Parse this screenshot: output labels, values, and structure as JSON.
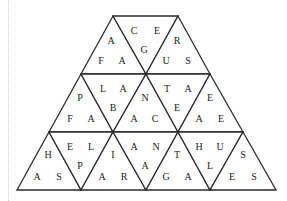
{
  "puzzle": {
    "type": "triangle-tarsia",
    "rows": 3,
    "triangles": [
      {
        "row": 0,
        "pts": "113,16 81,74 146,74",
        "dir": "up",
        "letters": [
          {
            "t": "A",
            "x": 111,
            "y": 42
          },
          {
            "t": "F",
            "x": 101,
            "y": 62
          },
          {
            "t": "A",
            "x": 122,
            "y": 62
          }
        ]
      },
      {
        "row": 0,
        "pts": "113,16 178,16 146,74",
        "dir": "down",
        "letters": [
          {
            "t": "C",
            "x": 134,
            "y": 32
          },
          {
            "t": "E",
            "x": 157,
            "y": 32
          },
          {
            "t": "G",
            "x": 144,
            "y": 51
          }
        ]
      },
      {
        "row": 0,
        "pts": "178,16 146,74 210,74",
        "dir": "up",
        "letters": [
          {
            "t": "R",
            "x": 177,
            "y": 42
          },
          {
            "t": "U",
            "x": 166,
            "y": 62
          },
          {
            "t": "S",
            "x": 188,
            "y": 62
          }
        ]
      },
      {
        "row": 1,
        "pts": "81,74 49,132 113,132",
        "dir": "up",
        "letters": [
          {
            "t": "P",
            "x": 80,
            "y": 99
          },
          {
            "t": "F",
            "x": 70,
            "y": 120
          },
          {
            "t": "A",
            "x": 91,
            "y": 120
          }
        ]
      },
      {
        "row": 1,
        "pts": "81,74 146,74 113,132",
        "dir": "down",
        "letters": [
          {
            "t": "L",
            "x": 103,
            "y": 90
          },
          {
            "t": "A",
            "x": 123,
            "y": 90
          },
          {
            "t": "B",
            "x": 113,
            "y": 109
          }
        ]
      },
      {
        "row": 1,
        "pts": "146,74 113,132 178,132",
        "dir": "up",
        "letters": [
          {
            "t": "N",
            "x": 145,
            "y": 99
          },
          {
            "t": "A",
            "x": 134,
            "y": 120
          },
          {
            "t": "C",
            "x": 155,
            "y": 120
          }
        ]
      },
      {
        "row": 1,
        "pts": "146,74 210,74 178,132",
        "dir": "down",
        "letters": [
          {
            "t": "T",
            "x": 167,
            "y": 90
          },
          {
            "t": "A",
            "x": 188,
            "y": 90
          },
          {
            "t": "E",
            "x": 177,
            "y": 109
          }
        ]
      },
      {
        "row": 1,
        "pts": "210,74 178,132 243,132",
        "dir": "up",
        "letters": [
          {
            "t": "E",
            "x": 210,
            "y": 99
          },
          {
            "t": "A",
            "x": 199,
            "y": 120
          },
          {
            "t": "E",
            "x": 221,
            "y": 120
          }
        ]
      },
      {
        "row": 2,
        "pts": "49,132 17,190 81,190",
        "dir": "up",
        "letters": [
          {
            "t": "H",
            "x": 48,
            "y": 156
          },
          {
            "t": "A",
            "x": 37,
            "y": 178
          },
          {
            "t": "S",
            "x": 59,
            "y": 178
          }
        ]
      },
      {
        "row": 2,
        "pts": "49,132 113,132 81,190",
        "dir": "down",
        "letters": [
          {
            "t": "E",
            "x": 70,
            "y": 148
          },
          {
            "t": "L",
            "x": 91,
            "y": 148
          },
          {
            "t": "P",
            "x": 80,
            "y": 167
          }
        ]
      },
      {
        "row": 2,
        "pts": "113,132 81,190 146,190",
        "dir": "up",
        "letters": [
          {
            "t": "I",
            "x": 113,
            "y": 156
          },
          {
            "t": "A",
            "x": 102,
            "y": 178
          },
          {
            "t": "R",
            "x": 124,
            "y": 178
          }
        ]
      },
      {
        "row": 2,
        "pts": "113,132 178,132 146,190",
        "dir": "down",
        "letters": [
          {
            "t": "A",
            "x": 134,
            "y": 148
          },
          {
            "t": "N",
            "x": 156,
            "y": 148
          },
          {
            "t": "A",
            "x": 145,
            "y": 167
          }
        ]
      },
      {
        "row": 2,
        "pts": "178,132 146,190 210,190",
        "dir": "up",
        "letters": [
          {
            "t": "T",
            "x": 177,
            "y": 156
          },
          {
            "t": "G",
            "x": 166,
            "y": 178
          },
          {
            "t": "A",
            "x": 188,
            "y": 178
          }
        ]
      },
      {
        "row": 2,
        "pts": "178,132 243,132 210,190",
        "dir": "down",
        "letters": [
          {
            "t": "H",
            "x": 199,
            "y": 148
          },
          {
            "t": "U",
            "x": 220,
            "y": 148
          },
          {
            "t": "L",
            "x": 210,
            "y": 167
          }
        ]
      },
      {
        "row": 2,
        "pts": "243,132 210,190 276,190",
        "dir": "up",
        "letters": [
          {
            "t": "S",
            "x": 243,
            "y": 156
          },
          {
            "t": "E",
            "x": 232,
            "y": 178
          },
          {
            "t": "S",
            "x": 254,
            "y": 178
          }
        ]
      }
    ]
  }
}
